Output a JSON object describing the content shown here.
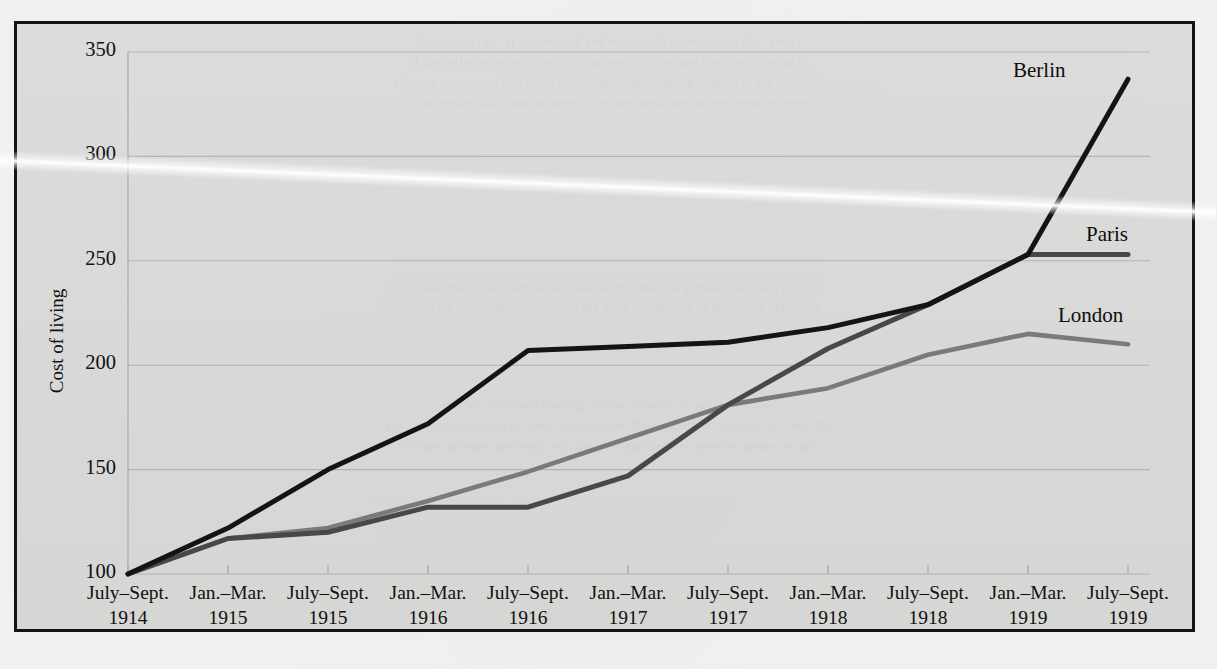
{
  "figure": {
    "y_axis_title": "Cost of living",
    "series_labels": {
      "berlin": "Berlin",
      "paris": "Paris",
      "london": "London"
    }
  },
  "bleed_text": {
    "top": "the manuscript.  It was revised and re-set with correction of the   errors\nof the earlier printing, in which a number of mistakes from the copying of\nthe text were noted and never corrected.   The resulting reading is not identical\nto the earlier draft, and, as noted in earlier work, the full text remains open.",
    "middle": "While the earlier editions are now scarce, the first printing has been used\nhere as the principal source, since the most recent state of the text is unknown.",
    "bottom": "though additional readings remain possible in several places.\nFor a fuller discussion of these questions see the appendix to volume II, where the\nrelevant passages are listed with their variants and discussed at greater length."
  },
  "chart_data": {
    "type": "line",
    "title": "",
    "xlabel": "",
    "ylabel": "Cost of living",
    "ylim": [
      100,
      350
    ],
    "yticks": [
      100,
      150,
      200,
      250,
      300,
      350
    ],
    "grid": true,
    "legend": "inline-end-labels",
    "categories": [
      {
        "period": "July–Sept.",
        "year": "1914"
      },
      {
        "period": "Jan.–Mar.",
        "year": "1915"
      },
      {
        "period": "July–Sept.",
        "year": "1915"
      },
      {
        "period": "Jan.–Mar.",
        "year": "1916"
      },
      {
        "period": "July–Sept.",
        "year": "1916"
      },
      {
        "period": "Jan.–Mar.",
        "year": "1917"
      },
      {
        "period": "July–Sept.",
        "year": "1917"
      },
      {
        "period": "Jan.–Mar.",
        "year": "1918"
      },
      {
        "period": "July–Sept.",
        "year": "1918"
      },
      {
        "period": "Jan.–Mar.",
        "year": "1919"
      },
      {
        "period": "July–Sept.",
        "year": "1919"
      }
    ],
    "series": [
      {
        "name": "Berlin",
        "color": "#141414",
        "width": 5.0,
        "values": [
          100,
          122,
          150,
          172,
          207,
          209,
          211,
          218,
          229,
          253,
          337
        ]
      },
      {
        "name": "Paris",
        "color": "#484848",
        "width": 5.0,
        "values": [
          100,
          117,
          120,
          132,
          132,
          147,
          181,
          208,
          229,
          253,
          253
        ]
      },
      {
        "name": "London",
        "color": "#7a7a7a",
        "width": 4.6,
        "values": [
          100,
          117,
          122,
          135,
          149,
          165,
          181,
          189,
          205,
          215,
          210
        ]
      }
    ]
  }
}
